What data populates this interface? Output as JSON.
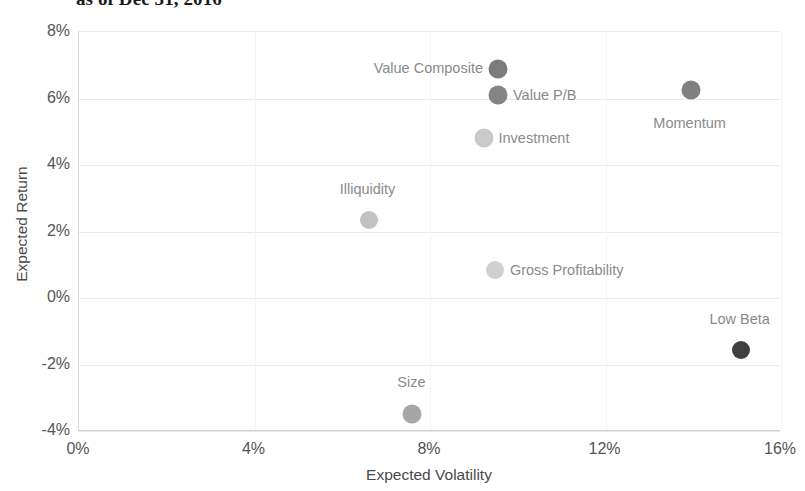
{
  "chart_data": {
    "type": "scatter",
    "title": "as of Dec 31, 2016",
    "xlabel": "Expected Volatility",
    "ylabel": "Expected Return",
    "xlim": [
      0,
      16
    ],
    "ylim": [
      -4,
      8
    ],
    "xticks": [
      "0%",
      "4%",
      "8%",
      "12%",
      "16%"
    ],
    "xtick_values": [
      0,
      4,
      8,
      12,
      16
    ],
    "yticks": [
      "8%",
      "6%",
      "4%",
      "2%",
      "0%",
      "-2%",
      "-4%"
    ],
    "ytick_values": [
      8,
      6,
      4,
      2,
      0,
      -2,
      -4
    ],
    "grid": true,
    "legend": "none",
    "points": [
      {
        "label": "Value Composite",
        "x": 9.55,
        "y": 6.9,
        "color": "#7b7b7b",
        "size": 19,
        "label_side": "left",
        "label_dx": -14,
        "label_dy": 0
      },
      {
        "label": "Value P/B",
        "x": 9.55,
        "y": 6.1,
        "color": "#848484",
        "size": 19,
        "label_side": "right",
        "label_dx": 16,
        "label_dy": 1
      },
      {
        "label": "Investment",
        "x": 9.22,
        "y": 4.8,
        "color": "#c9c9c9",
        "size": 19,
        "label_side": "right",
        "label_dx": 16,
        "label_dy": 1
      },
      {
        "label": "Momentum",
        "x": 13.94,
        "y": 6.25,
        "color": "#808080",
        "size": 19,
        "label_side": "above",
        "label_dx": 0,
        "label_dy": 42
      },
      {
        "label": "Illiquidity",
        "x": 6.6,
        "y": 2.35,
        "color": "#c2c2c2",
        "size": 18,
        "label_side": "above",
        "label_dx": 0,
        "label_dy": -22
      },
      {
        "label": "Gross Profitability",
        "x": 9.48,
        "y": 0.85,
        "color": "#d0d0d0",
        "size": 18,
        "label_side": "right",
        "label_dx": 16,
        "label_dy": 1
      },
      {
        "label": "Low Beta",
        "x": 15.08,
        "y": -1.55,
        "color": "#3f3f3f",
        "size": 18,
        "label_side": "above",
        "label_dx": 0,
        "label_dy": -22
      },
      {
        "label": "Size",
        "x": 7.6,
        "y": -3.5,
        "color": "#a6a6a6",
        "size": 19,
        "label_side": "above",
        "label_dx": 0,
        "label_dy": -23
      }
    ]
  }
}
